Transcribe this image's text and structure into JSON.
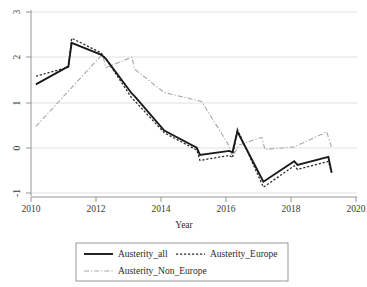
{
  "chart_data": {
    "type": "line",
    "title": "",
    "xlabel": "Year",
    "ylabel": "",
    "xlim": [
      2010,
      2020
    ],
    "ylim": [
      -1,
      3
    ],
    "grid": true,
    "xticks": [
      2010,
      2012,
      2014,
      2016,
      2018,
      2020
    ],
    "xtick_labels": [
      "2010",
      "2012",
      "2014",
      "2016",
      "2018",
      "2020"
    ],
    "yticks": [
      -1,
      0,
      1,
      2,
      3
    ],
    "ytick_labels": [
      "-1",
      "0",
      "1",
      "2",
      "3"
    ],
    "legend_position": "below-center",
    "series": [
      {
        "name": "Austerity_all",
        "style": "solid",
        "color": "#1a1a1a",
        "x": [
          2010.15,
          2011.15,
          2011.25,
          2012.15,
          2012.3,
          2013.1,
          2013.2,
          2014.1,
          2015.1,
          2015.2,
          2016.1,
          2016.2,
          2016.35,
          2017.15,
          2018.1,
          2018.2,
          2019.15,
          2019.25
        ],
        "y": [
          1.4,
          1.8,
          2.32,
          2.06,
          1.97,
          1.2,
          1.13,
          0.38,
          0.0,
          -0.16,
          -0.07,
          -0.1,
          0.36,
          -0.75,
          -0.3,
          -0.38,
          -0.2,
          -0.55
        ]
      },
      {
        "name": "Austerity_Europe",
        "style": "dotted",
        "color": "#2b2b2b",
        "x": [
          2010.15,
          2011.15,
          2011.25,
          2012.15,
          2012.3,
          2013.1,
          2013.2,
          2014.1,
          2015.1,
          2015.2,
          2016.1,
          2016.2,
          2016.35,
          2017.15,
          2018.1,
          2018.2,
          2019.15,
          2019.25
        ],
        "y": [
          1.58,
          1.78,
          2.42,
          2.1,
          1.97,
          1.1,
          1.03,
          0.33,
          -0.05,
          -0.28,
          -0.17,
          -0.22,
          0.41,
          -0.87,
          -0.4,
          -0.48,
          -0.3,
          -0.55
        ]
      },
      {
        "name": "Austerity_Non_Europe",
        "style": "dash-dot",
        "color": "#a7a7a7",
        "x": [
          2010.15,
          2012.2,
          2012.3,
          2013.1,
          2013.2,
          2014.1,
          2015.1,
          2015.25,
          2016.1,
          2016.2,
          2016.4,
          2017.1,
          2017.2,
          2018.1,
          2019.1,
          2019.25
        ],
        "y": [
          0.47,
          2.07,
          1.77,
          2.0,
          1.73,
          1.22,
          1.05,
          1.02,
          0.04,
          -0.2,
          0.06,
          0.23,
          -0.04,
          0.02,
          0.35,
          0.0
        ]
      }
    ]
  },
  "legend": {
    "entries": [
      {
        "label": "Austerity_all",
        "style": "solid"
      },
      {
        "label": "Austerity_Europe",
        "style": "dotted"
      },
      {
        "label": "Austerity_Non_Europe",
        "style": "dash-dot"
      }
    ]
  },
  "axes": {
    "x_axis_title": "Year"
  }
}
